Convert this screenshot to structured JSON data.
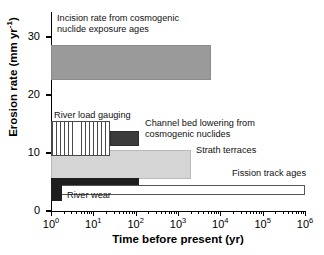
{
  "figure": {
    "background": "#ffffff"
  },
  "axes": {
    "x": {
      "label": "Time before present (yr)",
      "label_main": "Time before present (yr)",
      "scale": "log10",
      "min": 1,
      "max": 1000000,
      "tick_labels": [
        "10",
        "10",
        "10",
        "10",
        "10",
        "10",
        "10"
      ],
      "tick_exponents": [
        "0",
        "1",
        "2",
        "3",
        "4",
        "5",
        "6"
      ],
      "tick_values": [
        1,
        10,
        100,
        1000,
        10000,
        100000,
        1000000
      ],
      "minor_ticks": true
    },
    "y": {
      "label_text": "Erosion rate (mm yr",
      "label_exponent": "-1",
      "label_close": ")",
      "scale": "linear",
      "min": 0,
      "max": 33,
      "tick_labels": [
        "0",
        "10",
        "20",
        "30"
      ],
      "tick_values": [
        0,
        10,
        20,
        30
      ]
    }
  },
  "chart_data": {
    "type": "bar",
    "orientation": "horizontal-ranges",
    "title": "",
    "xlabel": "Time before present (yr)",
    "ylabel": "Erosion rate (mm yr^-1)",
    "xscale": "log",
    "xlim": [
      1,
      1000000
    ],
    "ylim": [
      0,
      33
    ],
    "grid": false,
    "legend": "inline-annotations",
    "series": [
      {
        "name": "Incision rate from cosmogenic nuclide exposure ages",
        "label": "Incision rate from cosmogenic\nnuclide exposure ages",
        "label_line1": "Incision rate from cosmogenic",
        "label_line2": "nuclide exposure ages",
        "x_range": [
          1,
          6000
        ],
        "y_range": [
          22.5,
          28.5
        ],
        "fill": "medium-gray",
        "color": "#9a9a9a"
      },
      {
        "name": "River load gauging",
        "label": "River load gauging",
        "x_range": [
          1,
          25
        ],
        "y_range": [
          9.5,
          15.5
        ],
        "fill": "vertical-hatch",
        "color": "#4a4a4a"
      },
      {
        "name": "Channel bed lowering from cosmogenic nuclides",
        "label": "Channel bed lowering from\ncosmogenic nuclides",
        "label_line1": "Channel bed lowering from",
        "label_line2": "cosmogenic nuclides",
        "x_range": [
          25,
          120
        ],
        "y_range": [
          11.2,
          13.8
        ],
        "fill": "dark-gray",
        "color": "#3b3b3b"
      },
      {
        "name": "Strath terraces",
        "label": "Strath terraces",
        "x_range": [
          1,
          2000
        ],
        "y_range": [
          5.5,
          10.5
        ],
        "fill": "light-gray",
        "color": "#d5d5d5"
      },
      {
        "name": "River wear band",
        "label": "River wear",
        "x_range": [
          1,
          120
        ],
        "y_range": [
          4.5,
          5.6
        ],
        "fill": "black",
        "color": "#1e1e1e"
      },
      {
        "name": "River wear block",
        "label": "River wear",
        "x_range": [
          1,
          1.8
        ],
        "y_range": [
          1.8,
          5.6
        ],
        "fill": "black",
        "color": "#1e1e1e"
      },
      {
        "name": "Fission track ages",
        "label": "Fission track ages",
        "x_range": [
          1,
          1000000
        ],
        "y_range": [
          2.7,
          4.5
        ],
        "fill": "open-white",
        "color": "#ffffff"
      }
    ]
  },
  "annotations": {
    "incision_line1": "Incision rate from cosmogenic",
    "incision_line2": "nuclide exposure ages",
    "river_load_gauging": "River load gauging",
    "channel_line1": "Channel bed lowering from",
    "channel_line2": "cosmogenic nuclides",
    "strath_terraces": "Strath terraces",
    "fission_track_ages": "Fission track ages",
    "river_wear": "River wear"
  }
}
